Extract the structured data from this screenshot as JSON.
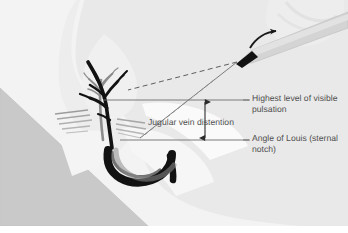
{
  "figure": {
    "background_color": "#ffffff"
  },
  "labels": {
    "highest_level": "Highest level of visible pulsation",
    "angle_of_louis": "Angle of Louis (sternal notch)",
    "jugular_vein_distention": "Jugular vein distention"
  },
  "colors": {
    "text": "#4f4f4f",
    "body_silhouette": "#e8e8e8",
    "bed_wedge": "#c9c9c9",
    "vein_dark": "#111111",
    "vein_gray": "#8d8d8d",
    "ruler": "#d2d2d2",
    "ruler_tip": "#111111",
    "reference_line": "#6e6e6e",
    "sight_line": "#6e6e6e",
    "hand": "#ececec",
    "muscle_hatch": "#9b9b9b"
  },
  "geometry": {
    "upper_reference_line_y": 100,
    "lower_reference_line_y": 140,
    "distention_arrow_x": 205,
    "ruler_tip_x": 237,
    "ruler_tip_y": 62
  },
  "elements": {
    "ruler_name": "measuring-ruler",
    "hand_name": "examiner-hand",
    "vein_name": "jugular-vein",
    "aorta_name": "aortic-arch",
    "arrow_name": "distention-arrow",
    "dashed_sight_line_name": "dashed-sight-line",
    "solid_sight_line_name": "solid-sight-line",
    "curved_arrow_name": "rotation-arrow"
  }
}
